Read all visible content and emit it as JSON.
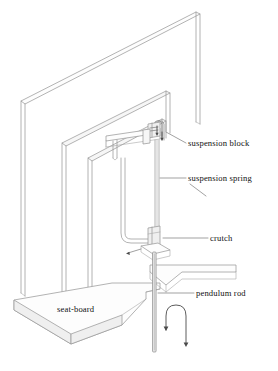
{
  "figure": {
    "style": {
      "background": "#ffffff",
      "line_color": "#9a9a9a",
      "label_color": "#111111",
      "arrow_color": "#4a4a4a"
    },
    "labels": [
      {
        "id": "suspension-block",
        "text": "suspension block",
        "x": 188,
        "y": 146
      },
      {
        "id": "suspension-spring",
        "text": "suspension spring",
        "x": 188,
        "y": 181
      },
      {
        "id": "crutch",
        "text": "crutch",
        "x": 210,
        "y": 241
      },
      {
        "id": "pendulum-rod",
        "text": "pendulum rod",
        "x": 196,
        "y": 296
      },
      {
        "id": "seat-board",
        "text": "seat-board",
        "x": 57,
        "y": 312
      }
    ],
    "parts": [
      {
        "id": "back-board",
        "name": "back board"
      },
      {
        "id": "middle-board",
        "name": "middle board"
      },
      {
        "id": "front-board",
        "name": "front board"
      },
      {
        "id": "seat-board-slab",
        "name": "seat-board slab"
      },
      {
        "id": "shelf",
        "name": "side shelf"
      },
      {
        "id": "suspension-block-part",
        "name": "suspension block"
      },
      {
        "id": "suspension-spring-part",
        "name": "suspension spring"
      },
      {
        "id": "crutch-part",
        "name": "crutch"
      },
      {
        "id": "pendulum-rod-part",
        "name": "pendulum rod"
      },
      {
        "id": "swing-arrow",
        "name": "oscillation arrow"
      }
    ]
  }
}
